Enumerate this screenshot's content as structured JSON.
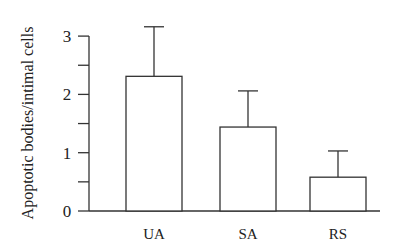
{
  "chart_data": {
    "type": "bar",
    "title": "",
    "xlabel": "",
    "ylabel": "Apoptotic bodies/intimal cells",
    "categories": [
      "UA",
      "SA",
      "RS"
    ],
    "values": [
      2.31,
      1.44,
      0.58
    ],
    "error_upper": [
      3.16,
      2.06,
      1.03
    ],
    "ylim": [
      0,
      3
    ],
    "yticks": [
      0,
      1,
      2,
      3
    ],
    "minor_ticks": [
      0.5,
      1.5,
      2.5
    ],
    "grid": false,
    "legend": null
  }
}
